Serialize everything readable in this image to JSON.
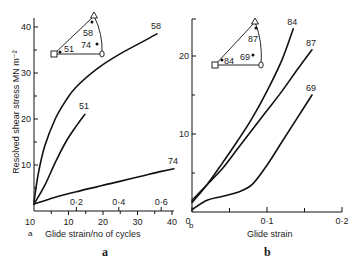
{
  "chart_data": [
    {
      "type": "line",
      "panel": "a",
      "panel_corner_label": "a",
      "panel_caption": "a",
      "ylabel": "Resolved shear stress MN m⁻²",
      "xlabel": "Glide strain/no of cycles",
      "ylim": [
        0,
        42
      ],
      "yticks": [
        10,
        20,
        30,
        40
      ],
      "y_minor_ticks": [
        5,
        15,
        25,
        35
      ],
      "xlim_cycles": [
        0,
        40
      ],
      "xticks_cycles": [
        10,
        20,
        30,
        40
      ],
      "x_origin_label": "10",
      "x_minor_ticks_cycles": [
        5,
        15,
        25,
        35
      ],
      "xlim_strain": [
        0,
        0.66
      ],
      "xticks_strain": [
        "0·2",
        "0·4",
        "0·6"
      ],
      "xticks_strain_values": [
        0.2,
        0.4,
        0.6
      ],
      "series": [
        {
          "name": "58",
          "x_strain": [
            0.0,
            0.02,
            0.05,
            0.1,
            0.15,
            0.2,
            0.3,
            0.4,
            0.5,
            0.58
          ],
          "y": [
            2,
            8,
            14,
            20,
            24,
            27,
            31,
            34,
            36.5,
            38.5
          ]
        },
        {
          "name": "51",
          "x_strain": [
            0.0,
            0.05,
            0.1,
            0.15,
            0.2,
            0.24
          ],
          "y": [
            1.5,
            5.5,
            10.5,
            15,
            18.5,
            21
          ]
        },
        {
          "name": "74",
          "x_strain": [
            0.0,
            0.1,
            0.2,
            0.3,
            0.4,
            0.5,
            0.6,
            0.66
          ],
          "y": [
            1.5,
            3,
            4.2,
            5.3,
            6.4,
            7.5,
            8.6,
            9.2
          ]
        }
      ],
      "inset": {
        "type": "stereographic-triangle",
        "corner_markers": [
          "square",
          "triangle",
          "circle"
        ],
        "points": [
          {
            "label": "58",
            "position": "near-apex"
          },
          {
            "label": "51",
            "position": "near-left-corner"
          },
          {
            "label": "74",
            "position": "near-right-corner"
          }
        ]
      }
    },
    {
      "type": "line",
      "panel": "b",
      "panel_corner_label": "b",
      "panel_caption": "b",
      "ylabel": "",
      "xlabel": "Glide strain",
      "ylim": [
        0,
        25
      ],
      "yticks": [
        10,
        20
      ],
      "y_minor_ticks": [
        5,
        15,
        25
      ],
      "xlim": [
        0,
        0.2
      ],
      "xticks": [
        "0",
        "0·1",
        "0·2"
      ],
      "xticks_values": [
        0,
        0.1,
        0.2
      ],
      "x_minor_ticks": [
        0.05,
        0.15
      ],
      "series": [
        {
          "name": "84",
          "x": [
            0.0,
            0.02,
            0.04,
            0.06,
            0.08,
            0.1,
            0.12,
            0.135
          ],
          "y": [
            1.2,
            3.5,
            6.2,
            9,
            12,
            15.5,
            19.5,
            23.5
          ]
        },
        {
          "name": "87",
          "x": [
            0.0,
            0.02,
            0.04,
            0.06,
            0.08,
            0.1,
            0.12,
            0.14,
            0.16
          ],
          "y": [
            1.5,
            3.5,
            5.5,
            8,
            10.5,
            13,
            15.5,
            18.2,
            20.8
          ]
        },
        {
          "name": "69",
          "x": [
            0.0,
            0.02,
            0.04,
            0.06,
            0.08,
            0.1,
            0.12,
            0.14,
            0.16
          ],
          "y": [
            0.3,
            1.5,
            2,
            2.5,
            3.5,
            6,
            9,
            12,
            15
          ]
        }
      ],
      "inset": {
        "type": "stereographic-triangle",
        "corner_markers": [
          "square",
          "triangle",
          "circle"
        ],
        "points": [
          {
            "label": "87",
            "position": "near-apex"
          },
          {
            "label": "84",
            "position": "near-left-corner"
          },
          {
            "label": "69",
            "position": "lower-middle"
          }
        ]
      }
    }
  ]
}
